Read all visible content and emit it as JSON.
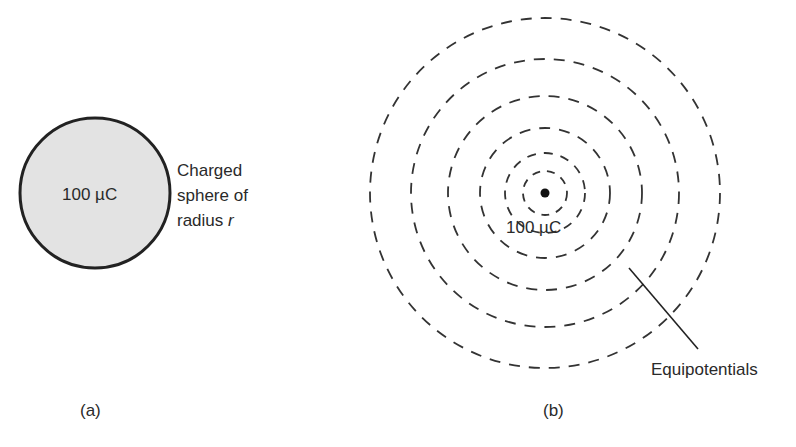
{
  "panel_a": {
    "caption": "(a)",
    "sphere_charge_label": "100 µC",
    "description_lines": [
      "Charged",
      "sphere of",
      "radius "
    ],
    "description_variable": "r",
    "sphere_fill": "#e3e3e3",
    "sphere_stroke": "#222222"
  },
  "panel_b": {
    "caption": "(b)",
    "point_charge_label": "100 µC",
    "callout_label": "Equipotentials",
    "ring_count": 6,
    "ring_stroke": "#333333"
  }
}
